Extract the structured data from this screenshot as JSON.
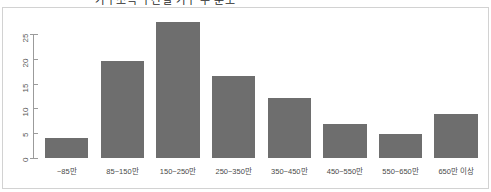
{
  "title": {
    "text": "가구소득 구간별 가구 수 분포",
    "visible_note": "cut off at top edge"
  },
  "chart_data": {
    "type": "bar",
    "title": "가구소득 구간별 가구 수 분포",
    "xlabel": "",
    "ylabel": "",
    "categories": [
      "~85만",
      "85~150만",
      "150~250만",
      "250~350만",
      "350~450만",
      "450~550만",
      "550~650만",
      "650만 이상"
    ],
    "values": [
      4,
      19.5,
      27.5,
      16.5,
      12,
      6.8,
      4.8,
      8.8
    ],
    "ylim": [
      0,
      27.5
    ],
    "yticks": [
      "0",
      "5",
      "10",
      "15",
      "20",
      "25"
    ],
    "ytick_values": [
      0,
      5,
      10,
      15,
      20,
      25
    ],
    "grid": false,
    "legend": "none",
    "bar_color": "#6e6e6e",
    "background_color": "#ffffff",
    "border_color": "#d2d2d2",
    "axis_color": "#9b9b9b"
  }
}
